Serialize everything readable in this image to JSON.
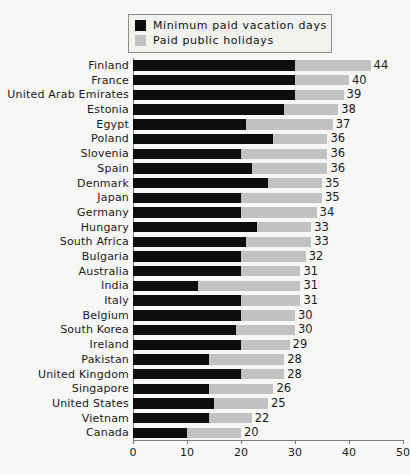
{
  "chart_data": {
    "type": "bar",
    "orientation": "horizontal",
    "stacked": true,
    "title": "",
    "xlabel": "",
    "ylabel": "",
    "xlim": [
      0,
      50
    ],
    "xticks": [
      0,
      10,
      20,
      30,
      40,
      50
    ],
    "grid": false,
    "legend_position": "top-center",
    "colors": {
      "minimum_paid_vacation_days": "#0d0d0d",
      "paid_public_holidays": "#c2c2c2",
      "background": "#f7f7f5",
      "axis": "#7d7d7d",
      "text": "#1a1a1a"
    },
    "legend": [
      {
        "label": "Minimum paid vacation days",
        "swatch": "#0d0d0d"
      },
      {
        "label": "Paid public holidays",
        "swatch": "#c2c2c2"
      }
    ],
    "categories": [
      "Finland",
      "France",
      "United Arab Emirates",
      "Estonia",
      "Egypt",
      "Poland",
      "Slovenia",
      "Spain",
      "Denmark",
      "Japan",
      "Germany",
      "Hungary",
      "South Africa",
      "Bulgaria",
      "Australia",
      "India",
      "Italy",
      "Belgium",
      "South Korea",
      "Ireland",
      "Pakistan",
      "United Kingdom",
      "Singapore",
      "United States",
      "Vietnam",
      "Canada"
    ],
    "series": [
      {
        "name": "Minimum paid vacation days",
        "values": [
          30,
          30,
          30,
          28,
          21,
          26,
          20,
          22,
          25,
          20,
          20,
          23,
          21,
          20,
          20,
          12,
          20,
          20,
          19,
          20,
          14,
          20,
          14,
          15,
          14,
          10
        ]
      },
      {
        "name": "Paid public holidays",
        "values": [
          14,
          10,
          9,
          10,
          16,
          10,
          16,
          14,
          10,
          15,
          14,
          10,
          12,
          12,
          11,
          19,
          11,
          10,
          11,
          9,
          14,
          8,
          12,
          10,
          8,
          10
        ]
      }
    ],
    "totals": [
      44,
      40,
      39,
      38,
      37,
      36,
      36,
      36,
      35,
      35,
      34,
      33,
      33,
      32,
      31,
      31,
      31,
      30,
      30,
      29,
      28,
      28,
      26,
      25,
      22,
      20
    ],
    "total_labels": [
      "44",
      "40",
      "39",
      "38",
      "37",
      "36",
      "36",
      "36",
      "35",
      "35",
      "34",
      "33",
      "33",
      "32",
      "31",
      "31",
      "31",
      "30",
      "30",
      "29",
      "28",
      "28",
      "26",
      "25",
      "22",
      "20"
    ],
    "xtick_labels": [
      "0",
      "10",
      "20",
      "30",
      "40",
      "50"
    ]
  }
}
